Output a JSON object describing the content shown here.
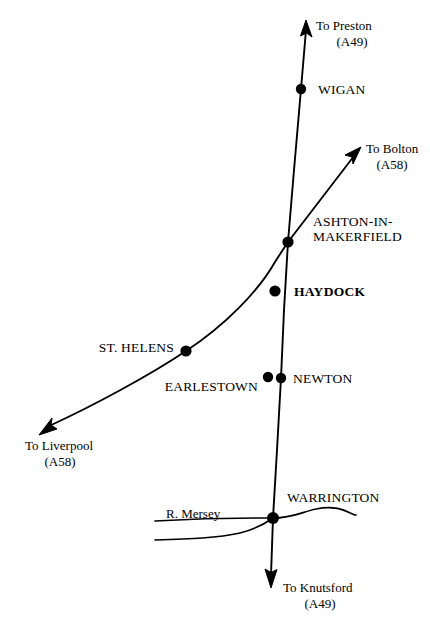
{
  "map": {
    "title": "Road map of the Haydock / Ashton-in-Makerfield area",
    "background_color": "#ffffff",
    "ink_color": "#000000",
    "roads": [
      {
        "id": "a49",
        "name": "A49",
        "orientation": "north-south",
        "from_label": "To Preston (A49)",
        "to_label": "To Knutsford (A49)"
      },
      {
        "id": "a58",
        "name": "A58",
        "orientation": "southwest-northeast",
        "from_label": "To Liverpool (A58)",
        "to_label": "To Bolton (A58)"
      }
    ],
    "destinations": [
      {
        "id": "preston",
        "line1": "To Preston",
        "line2": "(A49)",
        "x": 316,
        "y": 30,
        "anchor": "start"
      },
      {
        "id": "bolton",
        "line1": "To Bolton",
        "line2": "(A58)",
        "x": 366,
        "y": 153,
        "anchor": "start"
      },
      {
        "id": "liverpool",
        "line1": "To Liverpool",
        "line2": "(A58)",
        "x": 25,
        "y": 450,
        "anchor": "start"
      },
      {
        "id": "knutsford",
        "line1": "To Knutsford",
        "line2": "(A49)",
        "x": 283,
        "y": 592,
        "anchor": "start"
      }
    ],
    "towns": [
      {
        "id": "wigan",
        "label": "WIGAN",
        "dot_x": 301,
        "dot_y": 89,
        "label_x": 318,
        "label_y": 94,
        "anchor": "start",
        "bold": false,
        "dot_r": 5.2
      },
      {
        "id": "ashton",
        "label": "ASHTON-IN-",
        "label2": "MAKERFIELD",
        "dot_x": 288,
        "dot_y": 242,
        "label_x": 313,
        "label_y": 226,
        "anchor": "start",
        "bold": false,
        "dot_r": 5.6
      },
      {
        "id": "haydock",
        "label": "HAYDOCK",
        "dot_x": 275,
        "dot_y": 291,
        "label_x": 294,
        "label_y": 296,
        "anchor": "start",
        "bold": true,
        "dot_r": 5.6
      },
      {
        "id": "st-helens",
        "label": "ST. HELENS",
        "dot_x": 186,
        "dot_y": 351,
        "label_x": 174,
        "label_y": 352,
        "anchor": "end",
        "bold": false,
        "dot_r": 5.6
      },
      {
        "id": "earlestown",
        "label": "EARLESTOWN",
        "dot_x": 268,
        "dot_y": 377,
        "label_x": 258,
        "label_y": 391,
        "anchor": "end",
        "bold": false,
        "dot_r": 5.2
      },
      {
        "id": "newton",
        "label": "NEWTON",
        "dot_x": 281,
        "dot_y": 378,
        "label_x": 293,
        "label_y": 383,
        "anchor": "start",
        "bold": false,
        "dot_r": 5.2
      },
      {
        "id": "warrington",
        "label": "WARRINGTON",
        "dot_x": 273,
        "dot_y": 518,
        "label_x": 287,
        "label_y": 502,
        "anchor": "start",
        "bold": false,
        "dot_r": 6.0
      }
    ],
    "river": {
      "id": "mersey",
      "label": "R. Mersey",
      "label_x": 166,
      "label_y": 518,
      "anchor": "start"
    }
  }
}
